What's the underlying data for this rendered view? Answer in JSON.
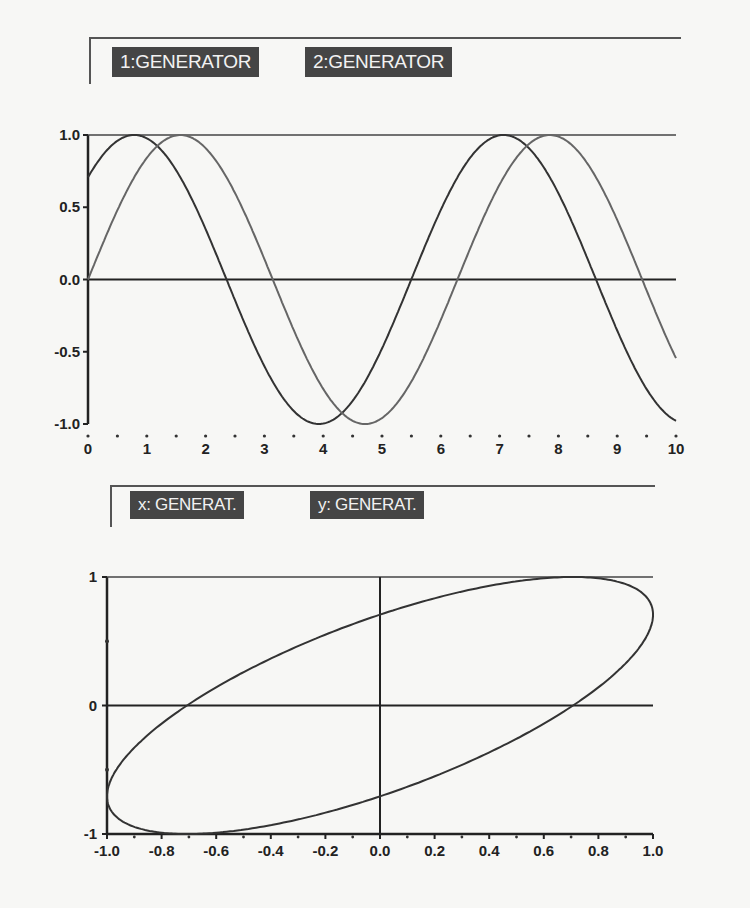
{
  "top_plot": {
    "labels": [
      "1:GENERATOR",
      "2:GENERATOR"
    ],
    "yticks": [
      "1.0",
      "0.5",
      "0.0",
      "-0.5",
      "-1.0"
    ],
    "xticks": [
      "0",
      "1",
      "2",
      "3",
      "4",
      "5",
      "6",
      "7",
      "8",
      "9",
      "10"
    ]
  },
  "bottom_plot": {
    "labels": [
      "x: GENERAT.",
      "y: GENERAT."
    ],
    "yticks": [
      "1",
      "0",
      "-1"
    ],
    "xticks": [
      "-1.0",
      "-0.8",
      "-0.6",
      "-0.4",
      "-0.2",
      "0.0",
      "0.2",
      "0.4",
      "0.6",
      "0.8",
      "1.0"
    ]
  },
  "colors": {
    "curve1": "#333333",
    "curve2": "#666666",
    "axis": "#222222",
    "label_bg": "#454545"
  },
  "chart_data": [
    {
      "type": "line",
      "title": "",
      "xlabel": "",
      "ylabel": "",
      "xlim": [
        0,
        10
      ],
      "ylim": [
        -1,
        1
      ],
      "xticks": [
        0,
        1,
        2,
        3,
        4,
        5,
        6,
        7,
        8,
        9,
        10
      ],
      "yticks": [
        -1.0,
        -0.5,
        0.0,
        0.5,
        1.0
      ],
      "legend": [
        "1:GENERATOR",
        "2:GENERATOR"
      ],
      "legend_position": "top",
      "grid": false,
      "x": [
        0,
        0.5,
        1,
        1.5,
        2,
        2.5,
        3,
        3.5,
        4,
        4.5,
        5,
        5.5,
        6,
        6.5,
        7,
        7.5,
        8,
        8.5,
        9,
        9.5,
        10
      ],
      "series": [
        {
          "name": "1:GENERATOR",
          "formula": "sin(x + pi/4)",
          "values": [
            0.71,
            0.98,
            0.98,
            0.7,
            0.24,
            -0.27,
            -0.72,
            -0.98,
            -0.97,
            -0.68,
            -0.26,
            0.29,
            0.74,
            0.99,
            0.97,
            0.66,
            0.2,
            -0.33,
            -0.76,
            -0.99,
            -0.95
          ]
        },
        {
          "name": "2:GENERATOR",
          "formula": "sin(x)",
          "values": [
            0.0,
            0.48,
            0.84,
            1.0,
            0.91,
            0.6,
            0.14,
            -0.35,
            -0.76,
            -0.98,
            -0.96,
            -0.71,
            -0.28,
            0.22,
            0.66,
            0.94,
            0.99,
            0.8,
            0.41,
            -0.08,
            -0.54
          ]
        }
      ]
    },
    {
      "type": "line",
      "title": "XY plot",
      "xlabel": "x: GENERAT.",
      "ylabel": "y: GENERAT.",
      "xlim": [
        -1,
        1
      ],
      "ylim": [
        -1,
        1
      ],
      "xticks": [
        -1.0,
        -0.8,
        -0.6,
        -0.4,
        -0.2,
        0.0,
        0.2,
        0.4,
        0.6,
        0.8,
        1.0
      ],
      "yticks": [
        -1,
        0,
        1
      ],
      "grid": false,
      "parametric": {
        "x": "sin(t)",
        "y": "sin(t + pi/4)"
      },
      "points": [
        [
          0,
          0.71
        ],
        [
          0.5,
          0.97
        ],
        [
          0.71,
          1.0
        ],
        [
          0.87,
          0.97
        ],
        [
          1.0,
          0.71
        ],
        [
          0.87,
          0.26
        ],
        [
          0.71,
          0.0
        ],
        [
          0.5,
          -0.26
        ],
        [
          0,
          -0.71
        ],
        [
          -0.5,
          -0.97
        ],
        [
          -0.71,
          -1.0
        ],
        [
          -0.87,
          -0.97
        ],
        [
          -1.0,
          -0.71
        ],
        [
          -0.87,
          -0.26
        ],
        [
          -0.71,
          0.0
        ],
        [
          -0.5,
          0.26
        ],
        [
          0,
          0.71
        ]
      ]
    }
  ]
}
